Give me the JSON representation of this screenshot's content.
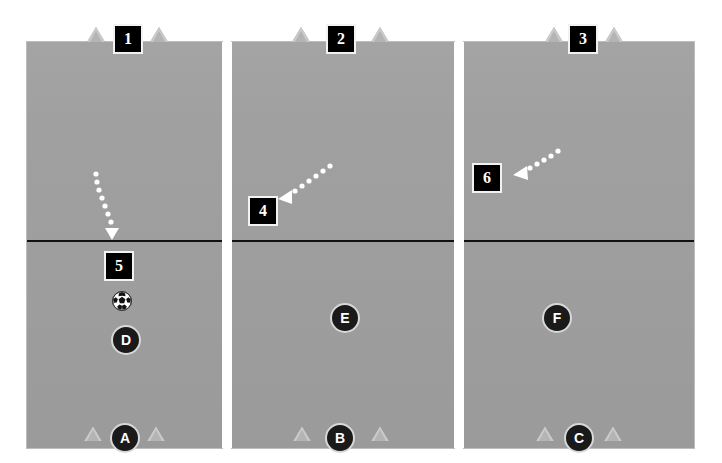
{
  "diagram": {
    "background_color": "#ffffff",
    "field_color": "#a0a0a0",
    "line_color": "#111111",
    "tag_color": "#000000",
    "player_color": "#1a1a1a",
    "cone_color": "#c9c9c9",
    "arrow_color": "#ffffff"
  },
  "panels": [
    {
      "name": "panel-1",
      "top_tag": "1"
    },
    {
      "name": "panel-2",
      "top_tag": "2"
    },
    {
      "name": "panel-3",
      "top_tag": "3"
    }
  ],
  "tags": [
    {
      "id": "tag-1",
      "label": "1"
    },
    {
      "id": "tag-2",
      "label": "2"
    },
    {
      "id": "tag-3",
      "label": "3"
    },
    {
      "id": "tag-4",
      "label": "4"
    },
    {
      "id": "tag-5",
      "label": "5"
    },
    {
      "id": "tag-6",
      "label": "6"
    }
  ],
  "players": [
    {
      "id": "player-a",
      "label": "A"
    },
    {
      "id": "player-b",
      "label": "B"
    },
    {
      "id": "player-c",
      "label": "C"
    },
    {
      "id": "player-d",
      "label": "D"
    },
    {
      "id": "player-e",
      "label": "E"
    },
    {
      "id": "player-f",
      "label": "F"
    }
  ],
  "ball": {
    "id": "soccer-ball",
    "label": ""
  }
}
